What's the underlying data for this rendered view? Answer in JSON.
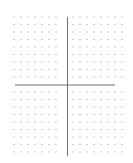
{
  "diagram": {
    "type": "dot-grid-coordinate-plane",
    "columns_left_of_axis": 7,
    "columns_right_of_axis": 8,
    "rows_above_axis": 9,
    "rows_below_axis": 9,
    "has_vertical_axis": true,
    "has_horizontal_axis": true,
    "colors": {
      "dot": "#9a9a9a",
      "axis": "#6e6e6e",
      "background": "#ffffff"
    }
  }
}
